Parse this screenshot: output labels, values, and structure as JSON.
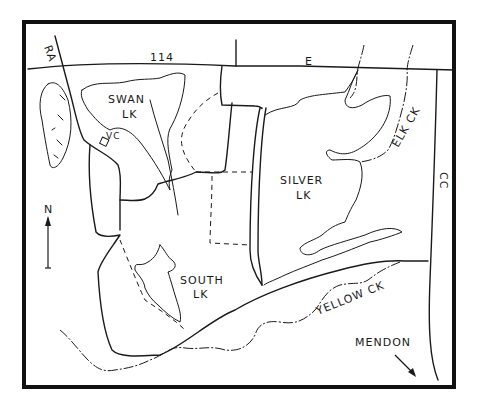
{
  "map": {
    "labels": {
      "route_114": "114",
      "route_e": "E",
      "route_ra": "RA",
      "route_cc": "CC",
      "swan_lake_line1": "SWAN",
      "swan_lake_line2": "LK",
      "visitor_center": "VC",
      "silver_lake_line1": "SILVER",
      "silver_lake_line2": "LK",
      "south_lake_line1": "SOUTH",
      "south_lake_line2": "LK",
      "elk_creek": "ELK CK",
      "yellow_creek": "YELLOW CK",
      "mendon": "MENDON",
      "north": "N"
    },
    "colors": {
      "ink": "#1a1a1a",
      "background": "#ffffff",
      "frame": "#111111"
    }
  }
}
